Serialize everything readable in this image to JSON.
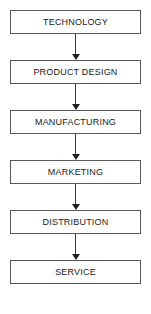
{
  "diagram": {
    "type": "linear-flowchart",
    "orientation": "vertical",
    "colors": {
      "background": "#ffffff",
      "box_border": "#595959",
      "box_fill": "#ffffff",
      "text": "#1a1a1a",
      "arrow": "#1f1f1f"
    },
    "nodes": [
      {
        "id": "technology",
        "label": "TECHNOLOGY"
      },
      {
        "id": "product-design",
        "label": "PRODUCT DESIGN"
      },
      {
        "id": "manufacturing",
        "label": "MANUFACTURING"
      },
      {
        "id": "marketing",
        "label": "MARKETING"
      },
      {
        "id": "distribution",
        "label": "DISTRIBUTION"
      },
      {
        "id": "service",
        "label": "SERVICE"
      }
    ],
    "connectors": [
      {
        "from": "technology",
        "to": "product-design",
        "style": "arrow-down"
      },
      {
        "from": "product-design",
        "to": "manufacturing",
        "style": "arrow-down"
      },
      {
        "from": "manufacturing",
        "to": "marketing",
        "style": "arrow-down"
      },
      {
        "from": "marketing",
        "to": "distribution",
        "style": "arrow-down"
      },
      {
        "from": "distribution",
        "to": "service",
        "style": "arrow-down"
      }
    ]
  }
}
